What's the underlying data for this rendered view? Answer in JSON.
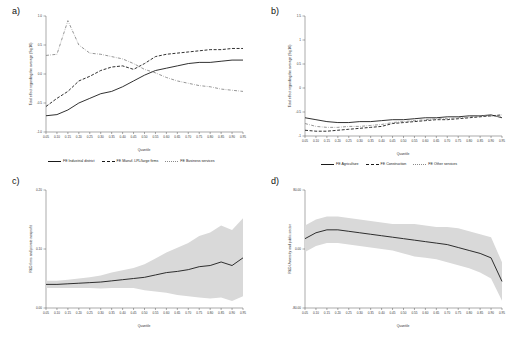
{
  "figure": {
    "panels": [
      {
        "letter": "a)",
        "ylabel": "Total effect regarding the average (Sq:10)",
        "xlabel": "Quantile",
        "yticks": [
          "1.0",
          "0.5",
          "0.0",
          "-0.5",
          "-1.0"
        ],
        "xticks": [
          "0.05",
          "0.10",
          "0.15",
          "0.20",
          "0.25",
          "0.30",
          "0.35",
          "0.40",
          "0.45",
          "0.50",
          "0.55",
          "0.60",
          "0.65",
          "0.70",
          "0.75",
          "0.80",
          "0.85",
          "0.90",
          "0.95"
        ],
        "legend": [
          {
            "label": "FE Industrial district",
            "style": "solid",
            "color": "#1a1a1a"
          },
          {
            "label": "FE Manuf. LPL/large firms",
            "style": "dash",
            "color": "#1a1a1a"
          },
          {
            "label": "FE Business services",
            "style": "dashdot",
            "color": "#8a8a8a"
          }
        ]
      },
      {
        "letter": "b)",
        "ylabel": "Total effect regarding the average (Sq:10)",
        "xlabel": "Quantile",
        "yticks": [
          "1.5",
          "1",
          "0.5",
          "0",
          "-0.5",
          "-1"
        ],
        "xticks": [
          "0.05",
          "0.10",
          "0.15",
          "0.20",
          "0.25",
          "0.30",
          "0.35",
          "0.40",
          "0.45",
          "0.50",
          "0.55",
          "0.60",
          "0.65",
          "0.70",
          "0.75",
          "0.80",
          "0.85",
          "0.90",
          "0.95"
        ],
        "legend": [
          {
            "label": "FE Agriculture",
            "style": "solid",
            "color": "#1a1a1a"
          },
          {
            "label": "FE Construction",
            "style": "dash",
            "color": "#1a1a1a"
          },
          {
            "label": "FE Other services",
            "style": "dashdot",
            "color": "#8a8a8a"
          }
        ]
      },
      {
        "letter": "c)",
        "ylabel": "R&D firms and private nonprofit",
        "xlabel": "Quantile",
        "yticks": [
          "0.20",
          "0.10",
          "0.00"
        ],
        "xticks": [
          "0.05",
          "0.10",
          "0.15",
          "0.20",
          "0.25",
          "0.30",
          "0.35",
          "0.40",
          "0.45",
          "0.50",
          "0.55",
          "0.60",
          "0.65",
          "0.70",
          "0.75",
          "0.80",
          "0.85",
          "0.90",
          "0.95"
        ],
        "legend": []
      },
      {
        "letter": "d)",
        "ylabel": "R&D University and public sector",
        "xlabel": "Quantile",
        "yticks": [
          "80.00",
          "0.00",
          "-80.00"
        ],
        "xticks": [
          "0.05",
          "0.10",
          "0.15",
          "0.20",
          "0.25",
          "0.30",
          "0.35",
          "0.40",
          "0.45",
          "0.50",
          "0.55",
          "0.60",
          "0.65",
          "0.70",
          "0.75",
          "0.80",
          "0.85",
          "0.90",
          "0.95"
        ],
        "legend": []
      }
    ]
  },
  "chart_data": [
    {
      "type": "line",
      "panel": "a)",
      "title": "",
      "xlabel": "Quantile",
      "ylabel": "Total effect regarding the average (Sq:10)",
      "x": [
        0.05,
        0.1,
        0.15,
        0.2,
        0.25,
        0.3,
        0.35,
        0.4,
        0.45,
        0.5,
        0.55,
        0.6,
        0.65,
        0.7,
        0.75,
        0.8,
        0.85,
        0.9,
        0.95
      ],
      "ylim": [
        -1.0,
        1.0
      ],
      "grid": false,
      "legend_position": "bottom",
      "series": [
        {
          "name": "FE Industrial district",
          "style": "solid",
          "color": "#1a1a1a",
          "values": [
            -0.72,
            -0.7,
            -0.62,
            -0.5,
            -0.42,
            -0.34,
            -0.3,
            -0.22,
            -0.12,
            -0.02,
            0.06,
            0.1,
            0.14,
            0.18,
            0.2,
            0.2,
            0.22,
            0.24,
            0.24
          ]
        },
        {
          "name": "FE Manuf. LPL/large firms",
          "style": "dash",
          "color": "#1a1a1a",
          "values": [
            -0.56,
            -0.42,
            -0.3,
            -0.12,
            -0.04,
            0.06,
            0.12,
            0.14,
            0.08,
            0.18,
            0.3,
            0.34,
            0.36,
            0.38,
            0.4,
            0.42,
            0.42,
            0.44,
            0.44
          ]
        },
        {
          "name": "FE Business services",
          "style": "dashdot",
          "color": "#8a8a8a",
          "values": [
            0.32,
            0.34,
            0.92,
            0.5,
            0.36,
            0.34,
            0.3,
            0.26,
            0.18,
            0.08,
            0.02,
            -0.06,
            -0.12,
            -0.16,
            -0.2,
            -0.22,
            -0.26,
            -0.28,
            -0.3
          ]
        }
      ]
    },
    {
      "type": "line",
      "panel": "b)",
      "title": "",
      "xlabel": "Quantile",
      "ylabel": "Total effect regarding the average (Sq:10)",
      "x": [
        0.05,
        0.1,
        0.15,
        0.2,
        0.25,
        0.3,
        0.35,
        0.4,
        0.45,
        0.5,
        0.55,
        0.6,
        0.65,
        0.7,
        0.75,
        0.8,
        0.85,
        0.9,
        0.95
      ],
      "ylim": [
        -1.0,
        1.5
      ],
      "grid": false,
      "legend_position": "bottom",
      "series": [
        {
          "name": "FE Agriculture",
          "style": "solid",
          "color": "#1a1a1a",
          "values": [
            -0.62,
            -0.66,
            -0.7,
            -0.72,
            -0.72,
            -0.7,
            -0.7,
            -0.68,
            -0.66,
            -0.66,
            -0.64,
            -0.62,
            -0.62,
            -0.6,
            -0.6,
            -0.58,
            -0.58,
            -0.56,
            -0.62
          ]
        },
        {
          "name": "FE Construction",
          "style": "dash",
          "color": "#1a1a1a",
          "values": [
            -0.88,
            -0.9,
            -0.9,
            -0.88,
            -0.86,
            -0.84,
            -0.82,
            -0.8,
            -0.74,
            -0.72,
            -0.7,
            -0.68,
            -0.66,
            -0.66,
            -0.64,
            -0.62,
            -0.6,
            -0.58,
            -0.56
          ]
        },
        {
          "name": "FE Other services",
          "style": "dashdot",
          "color": "#8a8a8a",
          "values": [
            -0.74,
            -0.8,
            -0.82,
            -0.82,
            -0.8,
            -0.8,
            -0.78,
            -0.76,
            -0.72,
            -0.7,
            -0.68,
            -0.66,
            -0.64,
            -0.64,
            -0.62,
            -0.6,
            -0.58,
            -0.58,
            -0.6
          ]
        }
      ]
    },
    {
      "type": "line",
      "panel": "c)",
      "title": "",
      "xlabel": "Quantile",
      "ylabel": "R&D firms and private nonprofit",
      "x": [
        0.05,
        0.1,
        0.15,
        0.2,
        0.25,
        0.3,
        0.35,
        0.4,
        0.45,
        0.5,
        0.55,
        0.6,
        0.65,
        0.7,
        0.75,
        0.8,
        0.85,
        0.9,
        0.95
      ],
      "ylim": [
        0.0,
        0.2
      ],
      "grid": false,
      "legend_position": "none",
      "series": [
        {
          "name": "Estimate",
          "style": "solid",
          "color": "#1a1a1a",
          "values": [
            0.04,
            0.04,
            0.041,
            0.042,
            0.043,
            0.044,
            0.046,
            0.048,
            0.05,
            0.052,
            0.056,
            0.06,
            0.062,
            0.065,
            0.07,
            0.072,
            0.078,
            0.072,
            0.085
          ]
        }
      ],
      "band": {
        "name": "95% confidence interval",
        "color": "#d9d9d9",
        "lower": [
          0.034,
          0.034,
          0.034,
          0.034,
          0.034,
          0.033,
          0.034,
          0.034,
          0.034,
          0.03,
          0.028,
          0.026,
          0.022,
          0.02,
          0.018,
          0.016,
          0.018,
          0.012,
          0.02
        ],
        "upper": [
          0.046,
          0.046,
          0.048,
          0.05,
          0.052,
          0.055,
          0.06,
          0.064,
          0.068,
          0.074,
          0.084,
          0.094,
          0.102,
          0.11,
          0.122,
          0.128,
          0.14,
          0.132,
          0.152
        ]
      }
    },
    {
      "type": "line",
      "panel": "d)",
      "title": "",
      "xlabel": "Quantile",
      "ylabel": "R&D University and public sector",
      "x": [
        0.05,
        0.1,
        0.15,
        0.2,
        0.25,
        0.3,
        0.35,
        0.4,
        0.45,
        0.5,
        0.55,
        0.6,
        0.65,
        0.7,
        0.75,
        0.8,
        0.85,
        0.9,
        0.95
      ],
      "ylim": [
        -80.0,
        80.0
      ],
      "grid": false,
      "legend_position": "none",
      "series": [
        {
          "name": "Estimate",
          "style": "solid",
          "color": "#1a1a1a",
          "values": [
            14,
            22,
            26,
            26,
            24,
            22,
            20,
            18,
            16,
            14,
            12,
            10,
            8,
            6,
            2,
            -2,
            -6,
            -12,
            -44
          ]
        }
      ],
      "band": {
        "name": "95% confidence interval",
        "color": "#d9d9d9",
        "lower": [
          -4,
          4,
          8,
          8,
          6,
          4,
          2,
          0,
          -2,
          -6,
          -10,
          -12,
          -14,
          -18,
          -22,
          -26,
          -32,
          -40,
          -70
        ],
        "upper": [
          32,
          40,
          44,
          44,
          42,
          40,
          38,
          36,
          34,
          34,
          34,
          32,
          30,
          30,
          28,
          24,
          20,
          16,
          -18
        ]
      }
    }
  ]
}
